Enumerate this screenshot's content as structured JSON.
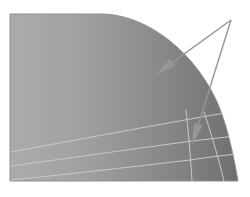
{
  "figure": {
    "title": "",
    "caption": "",
    "width": 250,
    "height": 197,
    "background_color": "#ffffff"
  },
  "chart_data": {
    "type": "area",
    "title": "",
    "subtitle": "",
    "xlabel": "",
    "ylabel": "",
    "xlim": [
      0,
      250
    ],
    "ylim": [
      0,
      197
    ],
    "grid": false,
    "legend": null,
    "region": {
      "name": "shaded-dome-region",
      "fill_left_color": "#a8a8a8",
      "fill_right_color": "#727272",
      "outline_color": "#8f8f8f",
      "flat_top_from_x": 10,
      "flat_top_to_x": 104,
      "top_y": 14,
      "bottom_y": 181,
      "left_x": 10,
      "right_max_x": 238,
      "path": "M 10,14 L 104,14 C 150,16 196,54 218,104 C 228,128 234,158 238,181 L 10,181 Z"
    },
    "contour_lines": [
      {
        "name": "contour-line-1",
        "color": "#c9c9c9",
        "width": 1,
        "path": "M 11,152 C 70,141 140,128 196,118 C 212,115 226,113 236,112"
      },
      {
        "name": "contour-line-2",
        "color": "#c9c9c9",
        "width": 1,
        "path": "M 11,166 C 70,158 140,148 192,141 C 210,139 226,137 237,136"
      },
      {
        "name": "contour-line-3",
        "color": "#c9c9c9",
        "width": 1,
        "path": "M 11,180 C 70,174 140,166 190,160 C 210,157 226,155 237,154"
      },
      {
        "name": "contour-line-4",
        "color": "#c9c9c9",
        "width": 1,
        "path": "M 186,110 C 188,128 190,150 192,181"
      },
      {
        "name": "contour-line-5",
        "color": "#c9c9c9",
        "width": 1,
        "path": "M 204,112 C 210,130 218,156 224,181"
      }
    ],
    "annotations": [
      {
        "name": "leader-arrow-upper",
        "color": "#969696",
        "width": 1.4,
        "apex": [
          231,
          20
        ],
        "tip": [
          155,
          75
        ],
        "label": ""
      },
      {
        "name": "leader-arrow-lower",
        "color": "#969696",
        "width": 1.4,
        "apex": [
          231,
          20
        ],
        "tip": [
          192,
          145
        ],
        "label": ""
      }
    ]
  }
}
